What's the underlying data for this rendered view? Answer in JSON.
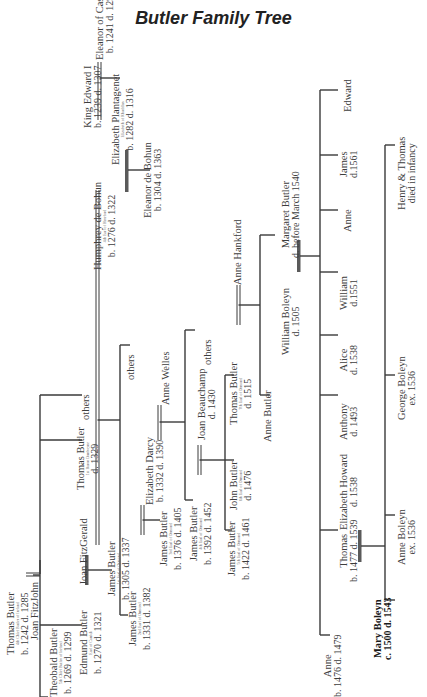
{
  "title": "Butler Family Tree",
  "people": {
    "thomas_butler_4": {
      "name": "Thomas Butler",
      "sub": "4th Chief Butler of Ireland",
      "dates": "b. 1242 d. 1285"
    },
    "joan_fitzjohn": {
      "name": "Joan FitzJohn"
    },
    "theobald_butler": {
      "name": "Theobald Butler",
      "sub": "5th Chief Butler of Ireland",
      "dates": "b. 1269 d. 1299"
    },
    "edmund_butler": {
      "name": "Edmund Butler",
      "sub": "Earl of Carrick",
      "dates": "b. 1270 d. 1321"
    },
    "joan_fitzgerald": {
      "name": "Joan FitzGerald"
    },
    "james_butler_1": {
      "name": "James Butler",
      "sub": "1st Earl of Ormond",
      "dates": "b. 1305 d. 1337"
    },
    "thomas_butler_dunboyne": {
      "name": "Thomas Butler",
      "sub": "1st Baron Dunboyne",
      "dates": "d. 1329"
    },
    "others_1": {
      "name": "others"
    },
    "humphrey_de_bohun": {
      "name": "Humphrey de Bohun",
      "sub": "4th Earl of Hereford",
      "dates": "b. 1276 d. 1322"
    },
    "king_edward_i": {
      "name": "King Edward I",
      "dates": "b. 1239 d. 1307"
    },
    "eleanor_of_castile": {
      "name": "Eleanor of Castile",
      "dates": "b. 1241 d. 1290"
    },
    "elizabeth_plantagenet": {
      "name": "Elizabeth Plantagenet",
      "sub": "Elizabeth of Rhuddlan",
      "dates": "b. 1282 d. 1316"
    },
    "eleanor_de_bohun": {
      "name": "Eleanor de Bohun",
      "dates": "b. 1304 d. 1363"
    },
    "james_butler_2": {
      "name": "James Butler",
      "sub": "2nd Earl of Ormond",
      "dates": "b. 1331 d. 1382"
    },
    "elizabeth_darcy": {
      "name": "Elizabeth Darcy",
      "dates": "b. 1332 d. 1390"
    },
    "others_2": {
      "name": "others"
    },
    "james_butler_3": {
      "name": "James Butler",
      "sub": "3rd Earl of Ormond",
      "dates": "b. 1376 d. 1405"
    },
    "anne_welles": {
      "name": "Anne Welles"
    },
    "james_butler_4": {
      "name": "James Butler",
      "sub": "4th Earl of Ormond",
      "dates": "b. 1392 d. 1452"
    },
    "joan_beauchamp": {
      "name": "Joan Beauchamp",
      "dates": "d. 1430"
    },
    "others_3": {
      "name": "others"
    },
    "james_butler_5": {
      "name": "James Butler",
      "sub": "5th Earl of Ormond",
      "dates": "b. 1422 d. 1461"
    },
    "john_butler_6": {
      "name": "John Butler",
      "sub": "6th Earl of Ormond",
      "dates": "d. 1476"
    },
    "thomas_butler_7": {
      "name": "Thomas Butler",
      "sub": "7th Earl of Ormond",
      "dates": "d. 1515"
    },
    "anne_hankford": {
      "name": "Anne Hankford"
    },
    "anne_butler": {
      "name": "Anne Butler"
    },
    "margaret_butler": {
      "name": "Margaret Butler",
      "dates": "d. before March 1540"
    },
    "william_boleyn": {
      "name": "William Boleyn",
      "dates": "d. 1505"
    },
    "anne_b": {
      "name": "Anne",
      "dates": "b. 1476 d. 1479"
    },
    "thomas_boleyn": {
      "name": "Thomas",
      "dates": "b. 1477 d. 1539"
    },
    "elizabeth_howard": {
      "name": "Elizabeth Howard",
      "dates": "d. 1538"
    },
    "anthony": {
      "name": "Anthony",
      "dates": "d. 1493"
    },
    "alice": {
      "name": "Alice",
      "dates": "d. 1538"
    },
    "william": {
      "name": "William",
      "dates": "d.1551"
    },
    "anne_c": {
      "name": "Anne"
    },
    "james": {
      "name": "James",
      "dates": "d.1561"
    },
    "edward": {
      "name": "Edward"
    },
    "mary_boleyn": {
      "name": "Mary Boleyn",
      "dates": "c. 1500 d. 1543"
    },
    "anne_boleyn": {
      "name": "Anne Boleyn",
      "dates": "ex. 1536"
    },
    "george_boleyn": {
      "name": "George Boleyn",
      "dates": "ex. 1536"
    },
    "henry_thomas": {
      "name": "Henry & Thomas",
      "dates": "died in infancy"
    }
  },
  "colors": {
    "line": "#3a3a3a",
    "marriage_bar": "#5a5a5a",
    "text": "#3d3d3d",
    "title": "#222222",
    "background": "#ffffff"
  }
}
